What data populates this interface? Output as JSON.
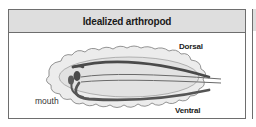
{
  "panel": {
    "title": "Idealized arthropod"
  },
  "diagram": {
    "labels": {
      "dorsal": "Dorsal",
      "ventral": "Ventral",
      "mouth": "mouth"
    },
    "colors": {
      "header_bg": "#dedede",
      "outer_body": "#ececec",
      "inner_body": "#e2e2e2",
      "dorsal_line": "#4a4a4a",
      "ventral_line": "#555555",
      "gut_line": "#6a6a6a",
      "outline": "#7a7a7a"
    }
  }
}
